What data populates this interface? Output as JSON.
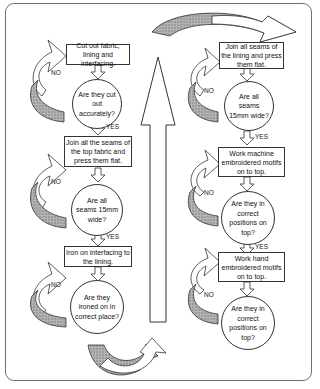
{
  "diagram": {
    "type": "flowchart",
    "colors": {
      "frame": "#6e6e6e",
      "stroke": "#333333",
      "hatch": "#9a9a9a"
    },
    "left_column": [
      {
        "step": "Cut out fabric, lining and interfacing.",
        "question": "Are they cut out accurately?",
        "yes": "YES",
        "no": "NO"
      },
      {
        "step": "Join all the seams of the top fabric and press them flat.",
        "question": "Are all seams 15mm wide?",
        "yes": "YES",
        "no": "NO"
      },
      {
        "step": "Iron on interfacing to the lining.",
        "question": "Are they ironed on in correct place?",
        "no": "NO"
      }
    ],
    "right_column": [
      {
        "step": "Join all seams of the lining and press them flat.",
        "question": "Are all seams 15mm wide?",
        "yes": "YES",
        "no": "NO"
      },
      {
        "step": "Work machine embroidered motifs on to top.",
        "question": "Are they in correct positions on top?",
        "yes": "YES",
        "no": "NO"
      },
      {
        "step": "Work hand embroidered motifs on to top.",
        "question": "Are they in correct positions on top?",
        "no": "NO"
      }
    ]
  }
}
